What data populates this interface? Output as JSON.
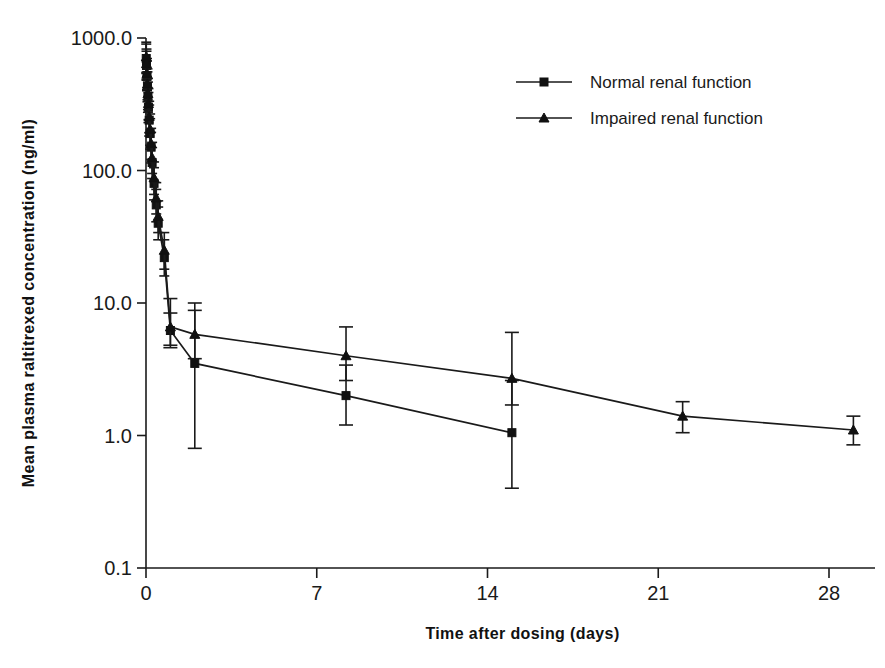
{
  "chart_data": {
    "type": "line",
    "title": "",
    "xlabel": "Time after dosing (days)",
    "ylabel": "Mean plasma raltitrexed concentration (ng/ml)",
    "yscale": "log",
    "ylim": [
      0.1,
      1000.0
    ],
    "xlim": [
      0,
      30
    ],
    "grid": false,
    "legend_position": "top-right",
    "y_tick_labels": [
      "1000.0",
      "100.0",
      "10.0",
      "1.0",
      "0.1"
    ],
    "y_tick_values": [
      1000.0,
      100.0,
      10.0,
      1.0,
      0.1
    ],
    "x_tick_labels": [
      "0",
      "7",
      "14",
      "21",
      "28"
    ],
    "x_tick_values": [
      0,
      7,
      14,
      21,
      28
    ],
    "error_bar_type": "standard deviation",
    "series": [
      {
        "name": "Normal renal function",
        "marker": "square",
        "x": [
          0.01,
          0.02,
          0.04,
          0.06,
          0.08,
          0.1,
          0.13,
          0.17,
          0.21,
          0.25,
          0.33,
          0.42,
          0.5,
          0.75,
          1.0,
          2.0,
          8.2,
          15.0
        ],
        "y": [
          700,
          620,
          520,
          430,
          360,
          300,
          240,
          190,
          150,
          115,
          80,
          55,
          40,
          22,
          6.2,
          3.5,
          2.0,
          1.05
        ],
        "yerr_low": [
          160,
          140,
          120,
          100,
          85,
          70,
          58,
          45,
          36,
          28,
          20,
          14,
          10,
          6,
          1.6,
          2.7,
          0.8,
          0.65
        ],
        "yerr_high": [
          200,
          175,
          150,
          125,
          105,
          88,
          72,
          56,
          44,
          34,
          25,
          17,
          13,
          8,
          2.2,
          6.5,
          1.4,
          1.55
        ]
      },
      {
        "name": "Impaired renal function",
        "marker": "triangle",
        "x": [
          0.01,
          0.02,
          0.04,
          0.06,
          0.08,
          0.1,
          0.13,
          0.17,
          0.21,
          0.25,
          0.33,
          0.42,
          0.5,
          0.75,
          1.0,
          2.0,
          8.2,
          15.0,
          22.0,
          29.0
        ],
        "y": [
          720,
          640,
          540,
          450,
          380,
          320,
          255,
          205,
          160,
          125,
          88,
          62,
          45,
          25,
          6.6,
          5.8,
          4.0,
          2.7,
          1.4,
          1.1
        ],
        "yerr_low": [
          170,
          150,
          130,
          108,
          92,
          78,
          62,
          50,
          39,
          30,
          22,
          15,
          11,
          7,
          1.8,
          2.0,
          1.4,
          1.0,
          0.35,
          0.25
        ],
        "yerr_high": [
          210,
          185,
          160,
          135,
          115,
          95,
          78,
          62,
          48,
          38,
          28,
          19,
          14,
          9,
          4.2,
          3.0,
          2.6,
          3.3,
          0.4,
          0.3
        ]
      }
    ]
  },
  "legend": {
    "items": [
      {
        "label": "Normal renal function",
        "marker": "square"
      },
      {
        "label": "Impaired renal function",
        "marker": "triangle"
      }
    ]
  },
  "axes": {
    "x_title": "Time after dosing (days)",
    "y_title": "Mean plasma raltitrexed concentration (ng/ml)"
  }
}
